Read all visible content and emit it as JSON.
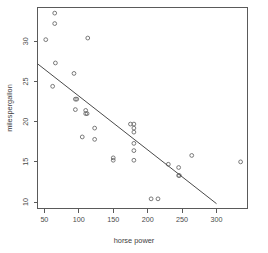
{
  "chart_data": {
    "type": "scatter",
    "title": "",
    "xlabel": "horse power",
    "ylabel": "milespergallon",
    "xlim": [
      40,
      345
    ],
    "ylim": [
      9.2,
      34.2
    ],
    "xticks": [
      50,
      100,
      150,
      200,
      250,
      300
    ],
    "yticks": [
      10,
      15,
      20,
      25,
      30
    ],
    "grid": false,
    "legend": null,
    "marker": "open-circle",
    "points": [
      {
        "x": 52,
        "y": 30.2
      },
      {
        "x": 65,
        "y": 33.5
      },
      {
        "x": 65,
        "y": 32.2
      },
      {
        "x": 66,
        "y": 27.3
      },
      {
        "x": 62,
        "y": 24.4
      },
      {
        "x": 93,
        "y": 26.0
      },
      {
        "x": 95,
        "y": 22.8
      },
      {
        "x": 97,
        "y": 22.8
      },
      {
        "x": 95,
        "y": 21.5
      },
      {
        "x": 110,
        "y": 21.4
      },
      {
        "x": 110,
        "y": 21.0
      },
      {
        "x": 112,
        "y": 21.0
      },
      {
        "x": 113,
        "y": 30.4
      },
      {
        "x": 105,
        "y": 18.1
      },
      {
        "x": 123,
        "y": 19.2
      },
      {
        "x": 123,
        "y": 17.8
      },
      {
        "x": 150,
        "y": 15.2
      },
      {
        "x": 150,
        "y": 15.5
      },
      {
        "x": 175,
        "y": 19.7
      },
      {
        "x": 180,
        "y": 19.7
      },
      {
        "x": 180,
        "y": 19.2
      },
      {
        "x": 180,
        "y": 18.7
      },
      {
        "x": 180,
        "y": 17.3
      },
      {
        "x": 180,
        "y": 16.4
      },
      {
        "x": 180,
        "y": 15.2
      },
      {
        "x": 205,
        "y": 10.4
      },
      {
        "x": 215,
        "y": 10.4
      },
      {
        "x": 230,
        "y": 14.7
      },
      {
        "x": 245,
        "y": 14.3
      },
      {
        "x": 245,
        "y": 13.3
      },
      {
        "x": 246,
        "y": 13.3
      },
      {
        "x": 264,
        "y": 15.8
      },
      {
        "x": 335,
        "y": 15.0
      }
    ],
    "fit_line": {
      "type": "linear",
      "x_start": 40,
      "y_start": 27.2,
      "x_end": 300,
      "y_end": 9.8
    }
  }
}
